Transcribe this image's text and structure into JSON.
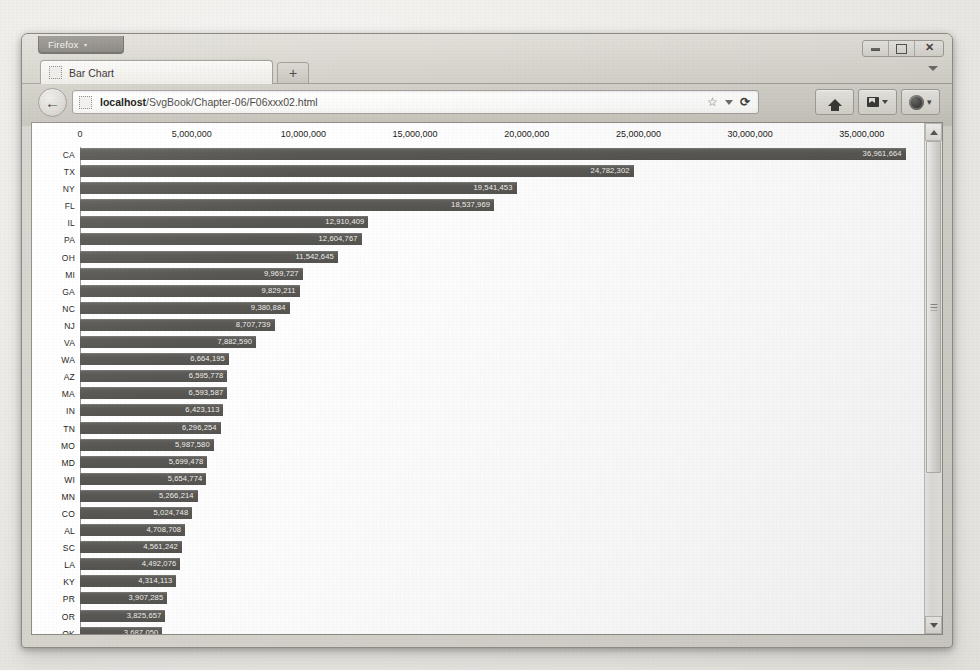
{
  "window": {
    "app_menu_label": "Firefox",
    "app_menu_caret": "▾",
    "controls": {
      "minimize": "minimize-icon",
      "maximize": "maximize-icon",
      "close": "✕"
    }
  },
  "tabs": {
    "items": [
      {
        "label": "Bar Chart",
        "favicon": "page-favicon"
      }
    ],
    "new_tab_label": "+",
    "list_all_tabs": "chevron-down-icon"
  },
  "navbar": {
    "back_label": "←",
    "url_host": "localhost",
    "url_path": "/SvgBook/Chapter-06/F06xxx02.html",
    "url_full": "localhost/SvgBook/Chapter-06/F06xxx02.html",
    "bookmark_icon": "☆",
    "bookmark_caret": "chevron-down-icon",
    "reload_label": "⟳",
    "buttons": [
      {
        "name": "home-button",
        "icon": "home-icon"
      },
      {
        "name": "library-button",
        "icon": "page-icon",
        "caret": "▾"
      },
      {
        "name": "account-button",
        "icon": "orb-icon",
        "caret": "▾"
      }
    ]
  },
  "scrollbar": {
    "up_arrow": "scroll-up-icon",
    "down_arrow": "scroll-down-icon",
    "thumb_grip": "scrollbar-grip"
  },
  "chart_data": {
    "type": "bar",
    "orientation": "horizontal",
    "title": "",
    "xlabel": "",
    "ylabel": "",
    "xlim": [
      0,
      38500000
    ],
    "grid": true,
    "legend": false,
    "xticks": [
      0,
      5000000,
      10000000,
      15000000,
      20000000,
      25000000,
      30000000,
      35000000
    ],
    "xtick_labels": [
      "0",
      "5,000,000",
      "10,000,000",
      "15,000,000",
      "20,000,000",
      "25,000,000",
      "30,000,000",
      "35,000,000"
    ],
    "bar_color": "#5b5955",
    "value_label_color": "#f2f1ef",
    "categories": [
      "CA",
      "TX",
      "NY",
      "FL",
      "IL",
      "PA",
      "OH",
      "MI",
      "GA",
      "NC",
      "NJ",
      "VA",
      "WA",
      "AZ",
      "MA",
      "IN",
      "TN",
      "MO",
      "MD",
      "WI",
      "MN",
      "CO",
      "AL",
      "SC",
      "LA",
      "KY",
      "PR",
      "OR",
      "OK"
    ],
    "values": [
      36961664,
      24782302,
      19541453,
      18537969,
      12910409,
      12604767,
      11542645,
      9969727,
      9829211,
      9380884,
      8707739,
      7882590,
      6664195,
      6595778,
      6593587,
      6423113,
      6296254,
      5987580,
      5699478,
      5654774,
      5266214,
      5024748,
      4708708,
      4561242,
      4492076,
      4314113,
      3907285,
      3825657,
      3687050
    ],
    "value_labels": [
      "36,961,664",
      "24,782,302",
      "19,541,453",
      "18,537,969",
      "12,910,409",
      "12,604,767",
      "11,542,645",
      "9,969,727",
      "9,829,211",
      "9,380,884",
      "8,707,739",
      "7,882,590",
      "6,664,195",
      "6,595,778",
      "6,593,587",
      "6,423,113",
      "6,296,254",
      "5,987,580",
      "5,699,478",
      "5,654,774",
      "5,266,214",
      "5,024,748",
      "4,708,708",
      "4,561,242",
      "4,492,076",
      "4,314,113",
      "3,907,285",
      "3,825,657",
      "3,687,050"
    ]
  }
}
